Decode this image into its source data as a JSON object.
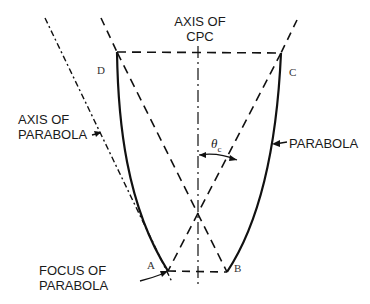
{
  "figure": {
    "labels": {
      "axis_of_cpc": [
        "AXIS OF",
        "CPC"
      ],
      "axis_of_parabola": [
        "AXIS OF",
        "PARABOLA"
      ],
      "parabola": "PARABOLA",
      "focus_of_parabola": [
        "FOCUS OF",
        "PARABOLA"
      ],
      "theta": "θ",
      "theta_sub": "c"
    },
    "points": {
      "A": "A",
      "B": "B",
      "C": "C",
      "D": "D"
    },
    "colors": {
      "line": "#111111",
      "background": "#ffffff"
    }
  }
}
